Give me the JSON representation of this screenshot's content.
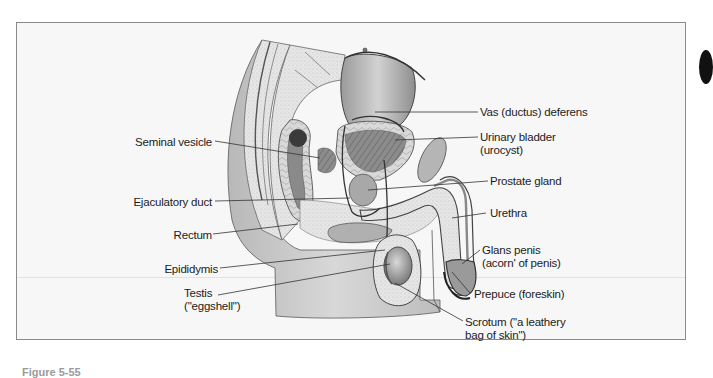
{
  "figure": {
    "caption_partial": "Figure 5-55",
    "labels_left": [
      {
        "id": "seminal-vesicle",
        "text": "Seminal vesicle"
      },
      {
        "id": "ejaculatory-duct",
        "text": "Ejaculatory duct"
      },
      {
        "id": "rectum",
        "text": "Rectum"
      },
      {
        "id": "epididymis",
        "text": "Epididymis"
      },
      {
        "id": "testis",
        "line1": "Testis",
        "line2": "(\"eggshell\")"
      }
    ],
    "labels_right": [
      {
        "id": "vas-deferens",
        "text": "Vas (ductus) deferens"
      },
      {
        "id": "urinary-bladder",
        "line1": "Urinary bladder",
        "line2": "(urocyst)"
      },
      {
        "id": "prostate-gland",
        "text": "Prostate gland"
      },
      {
        "id": "urethra",
        "text": "Urethra"
      },
      {
        "id": "glans-penis",
        "line1": "Glans penis",
        "line2": "(acorn' of penis)"
      },
      {
        "id": "prepuce",
        "text": "Prepuce (foreskin)"
      },
      {
        "id": "scrotum",
        "line1": "Scrotum (\"a leathery",
        "line2": "bag of skin\")"
      }
    ]
  }
}
